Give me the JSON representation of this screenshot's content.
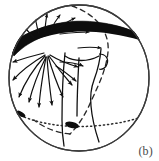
{
  "figure": {
    "panel_label": "(b)",
    "domain_kind": "schematic-diagram",
    "colors": {
      "ink": "#111111",
      "band_fill": "#0d0d0d",
      "outline": "#3b3b3b",
      "dashed": "#2a2a2a",
      "dotted": "#2a2a2a",
      "gap_fill": "#ffffff",
      "background": "#ffffff",
      "label_color": "#4a4a4a"
    },
    "sphere": {
      "name": "sphere-outline",
      "center_x": 79,
      "center_y": 78,
      "radius_x": 71,
      "radius_y": 74,
      "stroke_width": 1.3
    },
    "band": {
      "name": "dark-equatorial-band",
      "description": "thick dark arc crossing the sphere, thicker at left, tapering toward right",
      "left_x": 9,
      "right_x": 150,
      "apex_y": 36,
      "max_thickness": 13,
      "min_thickness": 7,
      "gap": {
        "name": "white-gap-window",
        "x": 40,
        "y": 42,
        "width": 5,
        "height": 8
      }
    },
    "dashed_meridian": {
      "name": "dashed-meridian-curve",
      "description": "dashed great-circle arc from top of sphere down through the tube to the lower equator",
      "dash_pattern": "5,4",
      "stroke_width": 1.3
    },
    "dotted_equator": {
      "name": "dotted-equator-line",
      "description": "dotted line across lower third of sphere",
      "dash_pattern": "1.2,3",
      "stroke_width": 1.4,
      "left_x": 16,
      "right_x": 145,
      "y": 119
    },
    "markers": [
      {
        "name": "equator-marker-left",
        "x": 20,
        "y": 115,
        "rx": 5,
        "ry": 2.2,
        "rotation": 38
      },
      {
        "name": "equator-marker-center",
        "x": 72,
        "y": 124,
        "rx": 7,
        "ry": 3.2,
        "rotation": 18
      }
    ],
    "tube": {
      "name": "flux-tube-outline",
      "description": "open tube / funnel descending from the band toward the equator",
      "stroke_width": 1.3
    },
    "arrows": {
      "name": "field-line-arrow-fan",
      "description": "fan of curved arrows radiating outward from a source point just below the white gap in the band",
      "source_x": 46,
      "source_y": 52,
      "count_below": 9,
      "count_above": 6,
      "count_right": 3,
      "stroke_width": 1.2,
      "head_size": 3.4
    }
  }
}
